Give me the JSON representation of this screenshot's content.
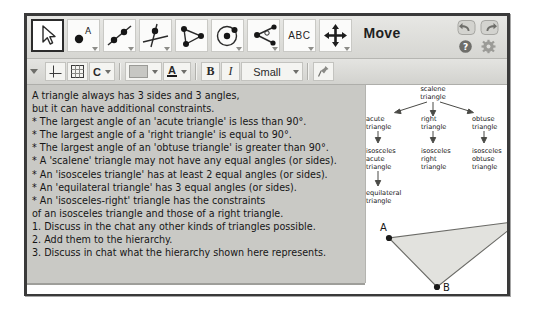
{
  "app": {
    "mode_label": "Move"
  },
  "toolbar": {
    "tools": [
      {
        "name": "move-tool",
        "icon": "arrow-cursor-icon",
        "selected": true,
        "has_caret": false
      },
      {
        "name": "point-tool",
        "icon": "point-a-icon",
        "selected": false,
        "has_caret": true
      },
      {
        "name": "line-tool",
        "icon": "line-through-points-icon",
        "selected": false,
        "has_caret": true
      },
      {
        "name": "perpendicular-line-tool",
        "icon": "perpendicular-line-icon",
        "selected": false,
        "has_caret": true
      },
      {
        "name": "polygon-tool",
        "icon": "polygon-icon",
        "selected": false,
        "has_caret": false
      },
      {
        "name": "circle-tool",
        "icon": "circle-center-point-icon",
        "selected": false,
        "has_caret": true
      },
      {
        "name": "angle-tool",
        "icon": "angle-measure-icon",
        "selected": false,
        "has_caret": true
      },
      {
        "name": "text-tool",
        "icon": "abc-text-icon",
        "label": "ABC",
        "selected": false,
        "has_caret": true
      },
      {
        "name": "move-graphics-tool",
        "icon": "move-four-arrows-icon",
        "selected": false,
        "has_caret": true
      }
    ],
    "window_buttons": [
      {
        "name": "undo-button",
        "icon": "undo-arrow-icon"
      },
      {
        "name": "redo-button",
        "icon": "redo-arrow-icon"
      },
      {
        "name": "help-button",
        "icon": "question-mark-icon"
      },
      {
        "name": "settings-button",
        "icon": "gear-icon"
      }
    ]
  },
  "formatbar": {
    "collapse_icon": "chevron-down-icon",
    "axes_label": "",
    "grid_label": "",
    "capture_label": "C",
    "color_label": "",
    "text_color_label": "A",
    "bold_label": "B",
    "italic_label": "I",
    "font_size": "Small",
    "pin_label": ""
  },
  "text_panel": {
    "lines": [
      "A triangle always has 3 sides and 3 angles,",
      "but it can have additional constraints.",
      "* The largest angle of an 'acute triangle' is less than 90°.",
      "* The largest angle of a 'right triangle' is equal to 90°.",
      "* The largest angle of an 'obtuse triangle' is greater than 90°.",
      "* A 'scalene' triangle may not have any equal angles (or sides).",
      "* An 'isosceles triangle' has at least 2 equal angles (or sides).",
      "* An 'equilateral triangle' has 3 equal angles (or sides).",
      "* An 'isosceles-right' triangle has the constraints",
      "of an isosceles triangle and those of a right triangle.",
      "1. Discuss in the chat any other kinds of triangles possible.",
      "2. Add them to the hierarchy.",
      "3. Discuss in chat what the hierarchy shown here represents."
    ]
  },
  "graphics": {
    "hierarchy": {
      "root": {
        "line1": "scalene",
        "line2": "triangle"
      },
      "branches": [
        {
          "line1": "acute",
          "line2": "triangle"
        },
        {
          "line1": "right",
          "line2": "triangle"
        },
        {
          "line1": "obtuse",
          "line2": "triangle"
        }
      ],
      "leaves": [
        {
          "line1": "isosceles",
          "line2": "acute",
          "line3": "triangle"
        },
        {
          "line1": "isosceles",
          "line2": "right",
          "line3": "triangle"
        },
        {
          "line1": "isosceles",
          "line2": "obtuse",
          "line3": "triangle"
        }
      ],
      "bottom": {
        "line1": "equilateral",
        "line2": "triangle"
      }
    },
    "triangle": {
      "vertices": [
        {
          "label": "A",
          "x": 23,
          "y": 153
        },
        {
          "label": "B",
          "x": 71,
          "y": 202
        },
        {
          "label": "C",
          "x": 154,
          "y": 136
        }
      ],
      "fill": "#e2e2de",
      "stroke": "#6a6a66"
    }
  }
}
